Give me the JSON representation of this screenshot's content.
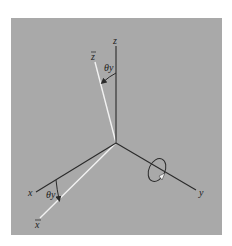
{
  "figure": {
    "background_color": "#a9a9a9",
    "axis_color": "#2a2a2a",
    "rotated_axis_color": "#f2f2f2",
    "labels": {
      "z": "z",
      "z_bar": "z",
      "x": "x",
      "x_bar": "x",
      "y": "y",
      "theta_top": "θy",
      "theta_bottom": "θy"
    },
    "rotation_angle_symbol": "θy",
    "rotation_axis": "y"
  }
}
